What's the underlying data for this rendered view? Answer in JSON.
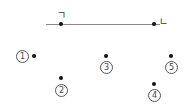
{
  "diagram": {
    "segment": {
      "x1": 46,
      "x2": 160,
      "y": 24,
      "color": "#8a8a8a"
    },
    "segment_points": [
      {
        "id": "g",
        "label": "ㄱ",
        "x": 61,
        "y": 24,
        "label_x": 57,
        "label_y": 10
      },
      {
        "id": "n",
        "label": "ㄴ",
        "x": 154,
        "y": 24,
        "label_x": 159,
        "label_y": 16
      }
    ],
    "options": [
      {
        "number": "1",
        "glyph": "1",
        "dot_x": 34,
        "dot_y": 56,
        "label_x": 16,
        "label_y": 50
      },
      {
        "number": "2",
        "glyph": "2",
        "dot_x": 61,
        "dot_y": 78,
        "label_x": 55,
        "label_y": 84
      },
      {
        "number": "3",
        "glyph": "3",
        "dot_x": 106,
        "dot_y": 56,
        "label_x": 100,
        "label_y": 61
      },
      {
        "number": "4",
        "glyph": "4",
        "dot_x": 154,
        "dot_y": 84,
        "label_x": 148,
        "label_y": 89
      },
      {
        "number": "5",
        "glyph": "5",
        "dot_x": 171,
        "dot_y": 56,
        "label_x": 165,
        "label_y": 61
      }
    ]
  }
}
